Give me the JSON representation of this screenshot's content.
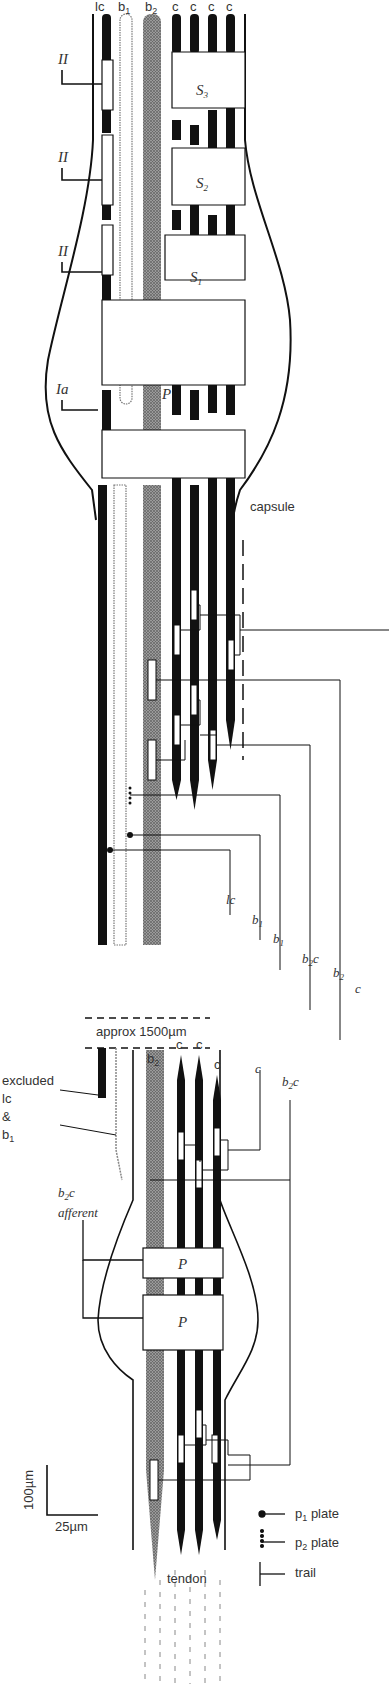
{
  "diagram": {
    "fibre_labels_top": [
      {
        "base": "lc",
        "sub": ""
      },
      {
        "base": "b",
        "sub": "1"
      },
      {
        "base": "b",
        "sub": "2"
      },
      {
        "base": "c",
        "sub": ""
      },
      {
        "base": "c",
        "sub": ""
      },
      {
        "base": "c",
        "sub": ""
      },
      {
        "base": "c",
        "sub": ""
      }
    ],
    "afferents_top": [
      {
        "label": "II",
        "target": "S3"
      },
      {
        "label": "II",
        "target": "S2"
      },
      {
        "label": "II",
        "target": "S1"
      },
      {
        "label": "Ia",
        "target": "P"
      }
    ],
    "regions_top": [
      {
        "base": "S",
        "sub": "3"
      },
      {
        "base": "S",
        "sub": "2"
      },
      {
        "base": "S",
        "sub": "1"
      },
      {
        "base": "P",
        "sub": ""
      }
    ],
    "capsule_label": "capsule",
    "motor_labels": [
      {
        "base": "lc",
        "sub": "",
        "tail": ""
      },
      {
        "base": "b",
        "sub": "1",
        "tail": ""
      },
      {
        "base": "b",
        "sub": "1",
        "tail": ""
      },
      {
        "base": "b",
        "sub": "2",
        "tail": "c"
      },
      {
        "base": "b",
        "sub": "2",
        "tail": ""
      },
      {
        "base": "c",
        "sub": "",
        "tail": ""
      }
    ],
    "break_label": "approx  1500µm",
    "lower_fibre_labels": [
      {
        "base": "b",
        "sub": "2"
      },
      {
        "base": "c",
        "sub": ""
      },
      {
        "base": "c",
        "sub": ""
      },
      {
        "base": "c",
        "sub": ""
      }
    ],
    "excluded_label": {
      "line1": "excluded",
      "line2": "lc",
      "line3": "&",
      "line4_base": "b",
      "line4_sub": "1"
    },
    "lower_motor_labels": [
      {
        "base": "c",
        "sub": "",
        "tail": ""
      },
      {
        "base": "b",
        "sub": "2",
        "tail": "c"
      }
    ],
    "b2c_afferent": {
      "base": "b",
      "sub": "2",
      "tail": "c",
      "line2": "afferent"
    },
    "regions_bottom": [
      "P",
      "P"
    ],
    "tendon_label": "tendon",
    "scale_bar": {
      "vertical": "100µm",
      "horizontal": "25µm"
    },
    "legend": [
      {
        "symbol": "p1-plate",
        "base": "p",
        "sub": "1",
        "text": "plate"
      },
      {
        "symbol": "p2-plate",
        "base": "p",
        "sub": "2",
        "text": "plate"
      },
      {
        "symbol": "trail",
        "base": "trail",
        "sub": "",
        "text": ""
      }
    ],
    "colors": {
      "ink": "#111111",
      "stipple": "#7a7a7a",
      "paper": "#ffffff",
      "text": "#333333"
    }
  }
}
